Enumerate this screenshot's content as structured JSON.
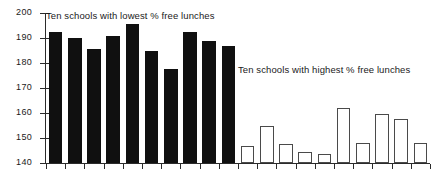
{
  "chart_data": {
    "type": "bar",
    "title": "",
    "xlabel": "",
    "ylabel": "",
    "ylim": [
      140,
      200
    ],
    "yticks": [
      140,
      150,
      160,
      170,
      180,
      190,
      200
    ],
    "ytick_labels": [
      "140",
      "150",
      "160",
      "170",
      "180",
      "190",
      "200"
    ],
    "grid": false,
    "legend_position": "inline-annotations",
    "series": [
      {
        "name": "Ten schools with lowest % free lunches",
        "style": "filled",
        "color": "#101010",
        "values": [
          192.5,
          190.0,
          185.5,
          191.0,
          195.5,
          185.0,
          177.5,
          192.5,
          189.0,
          187.0
        ]
      },
      {
        "name": "Ten schools with highest % free lunches",
        "style": "hollow",
        "color": "#ffffff",
        "edge_color": "#4a4a4a",
        "values": [
          147.0,
          155.0,
          147.5,
          144.5,
          143.5,
          162.0,
          148.0,
          159.5,
          157.5,
          148.0
        ]
      }
    ],
    "annotations": [
      {
        "id": "lowest-label",
        "text": "Ten schools with lowest % free lunches",
        "x": 46,
        "y": 10
      },
      {
        "id": "highest-label",
        "text": "Ten schools with highest % free lunches",
        "x": 238,
        "y": 64
      }
    ]
  },
  "axis": {
    "tick_labels": [
      "200",
      "190",
      "180",
      "170",
      "160",
      "150",
      "140"
    ]
  }
}
